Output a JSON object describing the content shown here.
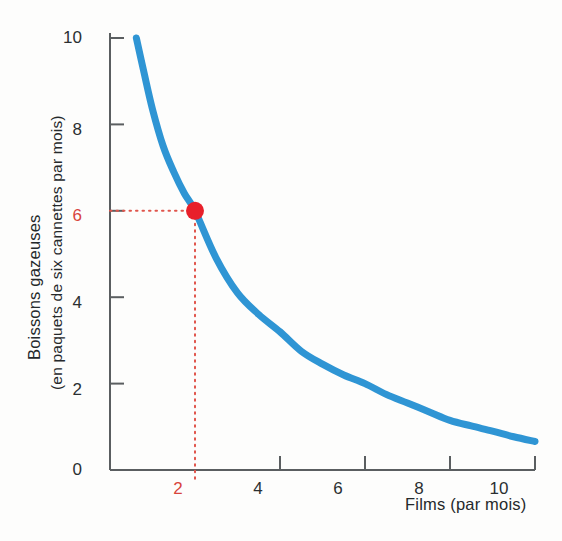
{
  "chart_data": {
    "type": "line",
    "title": "",
    "subtitle": "",
    "xlabel": "Films (par mois)",
    "ylabel_line1": "Boissons gazeuses",
    "ylabel_line2": "(en paquets de six cannettes par mois)",
    "xlim": [
      0,
      11
    ],
    "ylim": [
      0,
      10.8
    ],
    "grid": false,
    "legend": "none",
    "xticks": [
      2,
      4,
      6,
      8,
      10
    ],
    "xtick_labels": [
      "2",
      "4",
      "6",
      "8",
      "10"
    ],
    "yticks": [
      0,
      2,
      4,
      6,
      8,
      10
    ],
    "ytick_labels": [
      "0",
      "2",
      "4",
      "6",
      "8",
      "10"
    ],
    "series": [
      {
        "name": "indifference-curve",
        "color": "#2f95d4",
        "x": [
          0.62,
          0.8,
          1.0,
          1.25,
          1.5,
          1.75,
          2.0,
          2.5,
          3.0,
          3.5,
          4.0,
          4.5,
          5.0,
          5.5,
          6.0,
          6.5,
          7.0,
          7.5,
          8.0,
          8.5,
          9.0,
          9.5,
          10.0
        ],
        "y": [
          10.0,
          9.2,
          8.35,
          7.5,
          6.9,
          6.4,
          6.0,
          4.9,
          4.1,
          3.6,
          3.2,
          2.75,
          2.45,
          2.2,
          2.0,
          1.75,
          1.55,
          1.35,
          1.15,
          1.02,
          0.9,
          0.77,
          0.66
        ]
      }
    ],
    "annotated_points": [
      {
        "label": "c",
        "x": 2,
        "y": 6,
        "color": "#e8202a",
        "guide_color": "#e0554c",
        "guide_style": "dotted",
        "xtick_highlight": "2",
        "ytick_highlight": "6"
      }
    ]
  },
  "axis": {
    "line_color": "#5a5e60",
    "tick_color": "#5a5e60"
  },
  "labels": {
    "y_tick_10": "10",
    "y_tick_8": "8",
    "y_tick_6": "6",
    "y_tick_4": "4",
    "y_tick_2": "2",
    "y_tick_0": "0",
    "x_tick_2": "2",
    "x_tick_4": "4",
    "x_tick_6": "6",
    "x_tick_8": "8",
    "x_tick_10": "10",
    "point_c": "c",
    "x_axis_title": "Films (par mois)",
    "y_axis_title_1": "Boissons gazeuses",
    "y_axis_title_2": "(en paquets de six cannettes par mois)"
  }
}
